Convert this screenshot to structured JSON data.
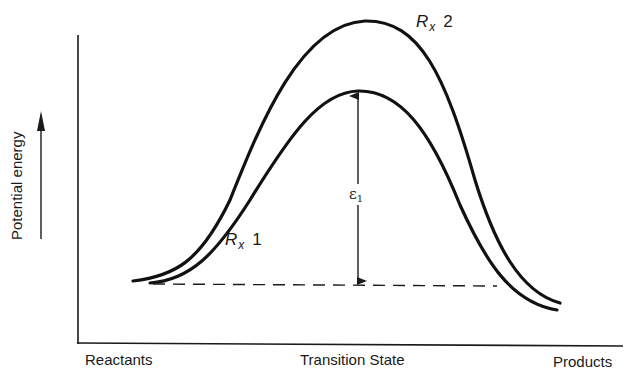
{
  "diagram": {
    "type": "reaction-energy-profile",
    "y_axis": {
      "label": "Potential energy",
      "arrow_direction": "up"
    },
    "x_axis": {
      "labels": [
        "Reactants",
        "Transition State",
        "Products"
      ]
    },
    "curves": [
      {
        "id": "rx2",
        "label_main": "R",
        "label_sub": "x",
        "label_num": "2",
        "description": "higher energy pathway"
      },
      {
        "id": "rx1",
        "label_main": "R",
        "label_sub": "x",
        "label_num": "1",
        "description": "lower energy pathway"
      }
    ],
    "activation_energy": {
      "symbol": "ε",
      "subscript": "1",
      "description": "double-headed arrow from reactant baseline to peak of Rx 1"
    },
    "baseline": {
      "style": "dashed",
      "description": "reactant energy level"
    },
    "colors": {
      "ink": "#1a1a1a",
      "background": "#ffffff"
    }
  }
}
